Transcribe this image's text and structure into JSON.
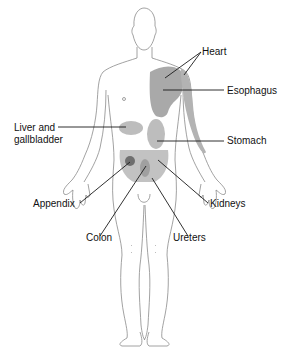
{
  "diagram": {
    "colors": {
      "shade_light": "#c8c8c8",
      "shade_mid": "#a9a9a9",
      "shade_dark": "#6e6e6e",
      "outline": "#8a8a8a",
      "leader": "#1a1a1a",
      "text": "#111111"
    },
    "labels": [
      {
        "id": "heart",
        "text": "Heart"
      },
      {
        "id": "esophagus",
        "text": "Esophagus"
      },
      {
        "id": "liver",
        "text": "Liver and\ngallbladder",
        "line1": "Liver and",
        "line2": "gallbladder"
      },
      {
        "id": "stomach",
        "text": "Stomach"
      },
      {
        "id": "appendix",
        "text": "Appendix"
      },
      {
        "id": "kidneys",
        "text": "Kidneys"
      },
      {
        "id": "colon",
        "text": "Colon"
      },
      {
        "id": "ureters",
        "text": "Ureters"
      }
    ]
  }
}
